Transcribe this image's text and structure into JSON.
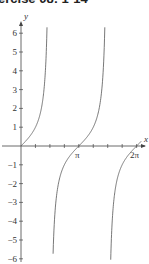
{
  "header": {
    "title": "ercise 08: 1-14"
  },
  "chart_data": {
    "type": "line",
    "title": "",
    "function": "y = tan(x)",
    "xlabel": "x",
    "ylabel": "y",
    "xlim": [
      -0.3,
      6.7
    ],
    "ylim": [
      -6.2,
      6.5
    ],
    "x_tick_labels": [
      "π",
      "2π"
    ],
    "x_tick_values": [
      3.14159,
      6.28319
    ],
    "y_tick_labels": [
      "-6",
      "-5",
      "-4",
      "-3",
      "-2",
      "-1",
      "1",
      "2",
      "3",
      "4",
      "5",
      "6"
    ],
    "y_tick_values": [
      -6,
      -5,
      -4,
      -3,
      -2,
      -1,
      1,
      2,
      3,
      4,
      5,
      6
    ],
    "grid": false,
    "asymptotes": [
      1.5708,
      4.7124
    ],
    "series": [
      {
        "name": "tan(x)",
        "color": "#555555"
      }
    ]
  },
  "labels": {
    "x_axis": "x",
    "y_axis": "y",
    "pi": "π",
    "two_pi": "2π"
  }
}
